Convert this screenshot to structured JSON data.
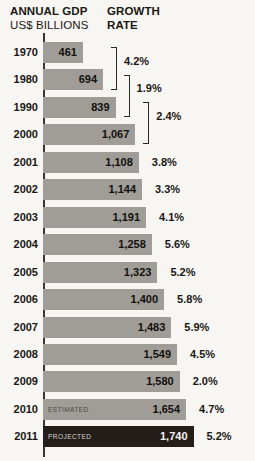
{
  "header": {
    "left_title": "ANNUAL GDP",
    "left_subtitle": "US$ BILLIONS",
    "right_title": "GROWTH",
    "right_subtitle": "RATE"
  },
  "colors": {
    "background": "#f7f6f3",
    "bar_gray": "#a09d98",
    "bar_dark": "#241d19",
    "text": "#1a1714",
    "axis": "#3a3531"
  },
  "chart_data": {
    "type": "bar",
    "orientation": "horizontal",
    "title": "ANNUAL GDP US$ BILLIONS",
    "xlabel": "US$ billions",
    "ylabel": "Year",
    "xlim": [
      0,
      1740
    ],
    "grid": false,
    "legend": "none",
    "categories": [
      "1970",
      "1980",
      "1990",
      "2000",
      "2001",
      "2002",
      "2003",
      "2004",
      "2005",
      "2006",
      "2007",
      "2008",
      "2009",
      "2010",
      "2011"
    ],
    "values": [
      461,
      694,
      839,
      1067,
      1108,
      1144,
      1191,
      1258,
      1323,
      1400,
      1483,
      1549,
      1580,
      1654,
      1740
    ],
    "value_labels": [
      "461",
      "694",
      "839",
      "1,067",
      "1,108",
      "1,144",
      "1,191",
      "1,258",
      "1,323",
      "1,400",
      "1,483",
      "1,549",
      "1,580",
      "1,654",
      "1,740"
    ],
    "growth_rate_labels": [
      "",
      "",
      "",
      "",
      "3.8%",
      "3.3%",
      "4.1%",
      "5.6%",
      "5.2%",
      "5.8%",
      "5.9%",
      "4.5%",
      "2.0%",
      "4.7%",
      "5.2%"
    ],
    "bar_notes": [
      "",
      "",
      "",
      "",
      "",
      "",
      "",
      "",
      "",
      "",
      "",
      "",
      "",
      "ESTIMATED",
      "PROJECTED"
    ],
    "bar_styles": [
      "gray",
      "gray",
      "gray",
      "gray",
      "gray",
      "gray",
      "gray",
      "gray",
      "gray",
      "gray",
      "gray",
      "gray",
      "gray",
      "gray",
      "dark"
    ],
    "decade_brackets": [
      {
        "between": [
          "1970",
          "1980"
        ],
        "label": "4.2%"
      },
      {
        "between": [
          "1980",
          "1990"
        ],
        "label": "1.9%"
      },
      {
        "between": [
          "1990",
          "2000"
        ],
        "label": "2.4%"
      }
    ]
  }
}
